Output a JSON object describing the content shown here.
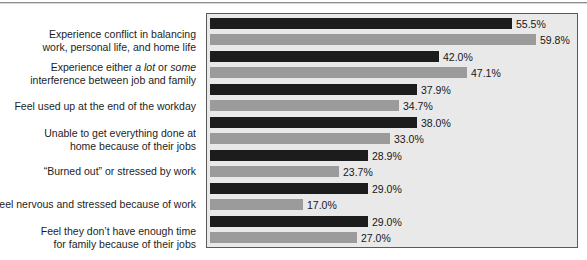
{
  "figure": {
    "background_color": "#ffffff",
    "panel_color": "#e9e9e9",
    "panel_border_color": "#5a5a5a",
    "series_colors": {
      "series1": "#1c1c1c",
      "series2": "#9b9b9b"
    }
  },
  "chart_data": {
    "type": "bar",
    "orientation": "horizontal",
    "title": "",
    "subtitle": "",
    "xlabel": "",
    "ylabel": "",
    "grid": false,
    "legend": "none",
    "xlim": [
      0,
      68
    ],
    "value_suffix": "%",
    "categories": [
      "Experience conflict in balancing work, personal life, and home life",
      "Experience either a lot or some interference between job and family",
      "Feel used up at the end of the workday",
      "Unable to get everything done at home because of their jobs",
      "“Burned out” or stressed by work",
      "Feel nervous and stressed because of work",
      "Feel they don’t have enough time for family because of their jobs"
    ],
    "series": [
      {
        "name": "series-1",
        "color": "#1c1c1c",
        "values": [
          55.5,
          42.0,
          37.9,
          38.0,
          28.9,
          29.0,
          29.0
        ]
      },
      {
        "name": "series-2",
        "color": "#9b9b9b",
        "values": [
          59.8,
          47.1,
          34.7,
          33.0,
          23.7,
          17.0,
          27.0
        ]
      }
    ],
    "value_labels": [
      [
        "55.5%",
        "59.8%"
      ],
      [
        "42.0%",
        "47.1%"
      ],
      [
        "37.9%",
        "34.7%"
      ],
      [
        "38.0%",
        "33.0%"
      ],
      [
        "28.9%",
        "23.7%"
      ],
      [
        "29.0%",
        "17.0%"
      ],
      [
        "29.0%",
        "27.0%"
      ]
    ]
  },
  "category_label_lines": [
    [
      "Experience conflict in balancing",
      "work, personal life, and home life"
    ],
    [
      "Experience either a lot or some",
      "interference between job and family"
    ],
    [
      "Feel used up at the end of the workday"
    ],
    [
      "Unable to get everything done at",
      "home because of their jobs"
    ],
    [
      "“Burned out” or stressed by work"
    ],
    [
      "Feel nervous and stressed because of work"
    ],
    [
      "Feel they don’t have enough time",
      "for family because of their jobs"
    ]
  ],
  "category_label_parts": {
    "row2_line1_pre": "Experience either ",
    "row2_line1_italic_a": "a lot",
    "row2_line1_mid": " or ",
    "row2_line1_italic_b": "some",
    "row2_line2": "interference between job and family"
  }
}
